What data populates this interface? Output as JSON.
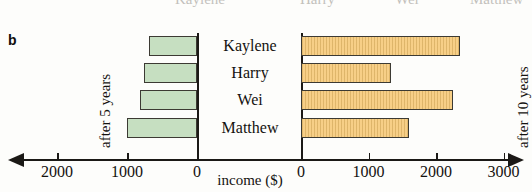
{
  "panel": {
    "letter": "b"
  },
  "ghost_row": [
    {
      "text": "Kaylene",
      "x": 175
    },
    {
      "text": "Harry",
      "x": 300
    },
    {
      "text": "Wei",
      "x": 395
    },
    {
      "text": "Matthew",
      "x": 470
    }
  ],
  "captions": {
    "left": "after 5 years",
    "right": "after 10 years"
  },
  "axis": {
    "title": "income ($)",
    "left_ticks": [
      "2000",
      "1000",
      "0"
    ],
    "right_ticks": [
      "0",
      "1000",
      "2000",
      "3000"
    ]
  },
  "colors": {
    "left_bar_fill": "#c6dfc1",
    "right_bar_fill": "#f7cf87",
    "bar_stroke": "#3c3a33",
    "axis": "#1b1916"
  },
  "chart_data": {
    "type": "bar",
    "title": "",
    "subtitle": "",
    "orientation": "horizontal",
    "layout": "back-to-back (population pyramid)",
    "categories": [
      "Kaylene",
      "Harry",
      "Wei",
      "Matthew"
    ],
    "xlabel": "income ($)",
    "ylabel": "",
    "grid": false,
    "legend": "none",
    "series": [
      {
        "name": "after 5 years",
        "side": "left",
        "color": "#c6dfc1",
        "axis_direction": "right-to-left",
        "xlim": [
          0,
          2500
        ],
        "ticks": [
          2000,
          1000,
          0
        ],
        "values": [
          690,
          760,
          820,
          1000
        ]
      },
      {
        "name": "after 10 years",
        "side": "right",
        "color": "#f7cf87",
        "axis_direction": "left-to-right",
        "xlim": [
          0,
          3100
        ],
        "ticks": [
          0,
          1000,
          2000,
          3000
        ],
        "values": [
          2350,
          1330,
          2250,
          1600
        ]
      }
    ]
  }
}
